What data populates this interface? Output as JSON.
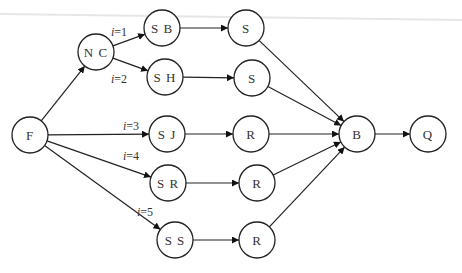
{
  "diagram": {
    "type": "directed-graph",
    "node_radius": 18,
    "colors": {
      "stroke": "#222222",
      "fill": "#ffffff",
      "text": "#333333"
    },
    "nodes": [
      {
        "id": "F",
        "label": "F",
        "x": 30,
        "y": 135
      },
      {
        "id": "NC",
        "label": "N C",
        "x": 96,
        "y": 52
      },
      {
        "id": "SB",
        "label": "S B",
        "x": 162,
        "y": 28
      },
      {
        "id": "SH",
        "label": "S H",
        "x": 165,
        "y": 77
      },
      {
        "id": "SJ",
        "label": "S J",
        "x": 167,
        "y": 134
      },
      {
        "id": "SR",
        "label": "S R",
        "x": 168,
        "y": 183
      },
      {
        "id": "SS",
        "label": "S S",
        "x": 175,
        "y": 240
      },
      {
        "id": "S1",
        "label": "S",
        "x": 246,
        "y": 28
      },
      {
        "id": "S2",
        "label": "S",
        "x": 252,
        "y": 78
      },
      {
        "id": "R1",
        "label": "R",
        "x": 251,
        "y": 134
      },
      {
        "id": "R2",
        "label": "R",
        "x": 257,
        "y": 183
      },
      {
        "id": "R3",
        "label": "R",
        "x": 257,
        "y": 240
      },
      {
        "id": "B",
        "label": "B",
        "x": 357,
        "y": 134
      },
      {
        "id": "Q",
        "label": "Q",
        "x": 428,
        "y": 134
      }
    ],
    "edges": [
      {
        "from": "F",
        "to": "NC",
        "label": ""
      },
      {
        "from": "NC",
        "to": "SB",
        "label": "i=1",
        "lx": 111,
        "ly": 36
      },
      {
        "from": "NC",
        "to": "SH",
        "label": "i=2",
        "lx": 111,
        "ly": 83
      },
      {
        "from": "F",
        "to": "SJ",
        "label": "i=3",
        "lx": 123,
        "ly": 130
      },
      {
        "from": "F",
        "to": "SR",
        "label": "i=4",
        "lx": 123,
        "ly": 160
      },
      {
        "from": "F",
        "to": "SS",
        "label": "i=5",
        "lx": 137,
        "ly": 216
      },
      {
        "from": "SB",
        "to": "S1",
        "label": ""
      },
      {
        "from": "SH",
        "to": "S2",
        "label": ""
      },
      {
        "from": "SJ",
        "to": "R1",
        "label": ""
      },
      {
        "from": "SR",
        "to": "R2",
        "label": ""
      },
      {
        "from": "SS",
        "to": "R3",
        "label": ""
      },
      {
        "from": "S1",
        "to": "B",
        "label": ""
      },
      {
        "from": "S2",
        "to": "B",
        "label": ""
      },
      {
        "from": "R1",
        "to": "B",
        "label": ""
      },
      {
        "from": "R2",
        "to": "B",
        "label": ""
      },
      {
        "from": "R3",
        "to": "B",
        "label": ""
      },
      {
        "from": "B",
        "to": "Q",
        "label": ""
      }
    ]
  }
}
